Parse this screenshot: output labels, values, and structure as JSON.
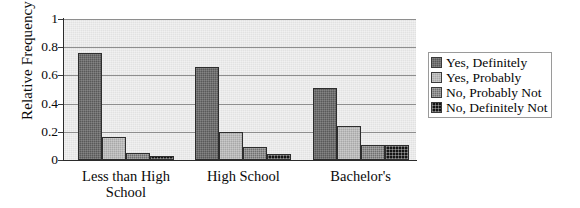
{
  "chart_data": {
    "type": "bar",
    "title": "",
    "xlabel": "",
    "ylabel": "Relative Frequency",
    "ylim": [
      0,
      1
    ],
    "yticks": [
      0,
      0.2,
      0.4,
      0.6,
      0.8,
      1
    ],
    "ytick_labels": [
      "0",
      "0.2",
      "0.4",
      "0.6",
      "0.8",
      "1"
    ],
    "grid": true,
    "legend_position": "right",
    "categories": [
      "Less than High School",
      "High School",
      "Bachelor's"
    ],
    "series": [
      {
        "name": "Yes, Definitely",
        "color": "#595959",
        "values": [
          0.76,
          0.66,
          0.51
        ]
      },
      {
        "name": "Yes, Probably",
        "color": "#a8a8a8",
        "values": [
          0.16,
          0.2,
          0.24
        ]
      },
      {
        "name": "No, Probably Not",
        "color": "#6f6f6f",
        "values": [
          0.05,
          0.09,
          0.11
        ]
      },
      {
        "name": "No, Definitely Not",
        "color": "#141414",
        "values": [
          0.025,
          0.045,
          0.11
        ]
      }
    ]
  },
  "axis": {
    "y_title": "Relative Frequency",
    "ticks": [
      {
        "label": "1",
        "value": 1
      },
      {
        "label": "0.8",
        "value": 0.8
      },
      {
        "label": "0.6",
        "value": 0.6
      },
      {
        "label": "0.4",
        "value": 0.4
      },
      {
        "label": "0.2",
        "value": 0.2
      },
      {
        "label": "0",
        "value": 0
      }
    ]
  },
  "categories": [
    {
      "line1": "Less than High",
      "line2": "School"
    },
    {
      "line1": "High School",
      "line2": ""
    },
    {
      "line1": "Bachelor's",
      "line2": ""
    }
  ],
  "legend": {
    "items": [
      {
        "label": "Yes, Definitely",
        "color": "#595959"
      },
      {
        "label": "Yes, Probably",
        "color": "#a8a8a8"
      },
      {
        "label": "No, Probably Not",
        "color": "#6f6f6f"
      },
      {
        "label": "No, Definitely Not",
        "color": "#141414"
      }
    ]
  }
}
